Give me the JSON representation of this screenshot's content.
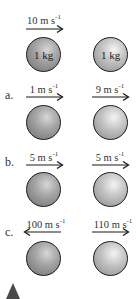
{
  "initial": {
    "velocity": "10 m s",
    "velocity_exp": "-1",
    "direction": "right",
    "ball_left_mass": "1 kg",
    "ball_right_mass": "1 kg"
  },
  "options": [
    {
      "label": "a.",
      "left_velocity": "1 m s",
      "left_exp": "-1",
      "left_dir": "right",
      "right_velocity": "9 m s",
      "right_exp": "-1",
      "right_dir": "right"
    },
    {
      "label": "b.",
      "left_velocity": "5 m s",
      "left_exp": "-1",
      "left_dir": "right",
      "right_velocity": "5 m s",
      "right_exp": "-1",
      "right_dir": "right"
    },
    {
      "label": "c.",
      "left_velocity": "100 m s",
      "left_exp": "-1",
      "left_dir": "left",
      "right_velocity": "110 m s",
      "right_exp": "-1",
      "right_dir": "right"
    }
  ],
  "colors": {
    "ball_border": "#1a1a1a",
    "arrow": "#1a1a1a",
    "triangle": "#4a4a4a"
  }
}
